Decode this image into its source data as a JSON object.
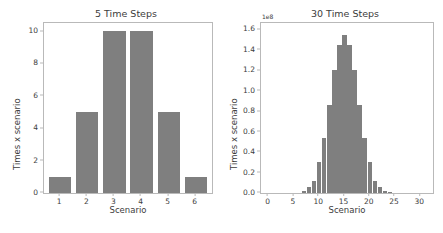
{
  "figure": {
    "background_color": "#ffffff",
    "bar_color": "#7f7f7f",
    "axis_color": "#b9b9b9"
  },
  "chart_data": [
    {
      "type": "bar",
      "title": "5 Time Steps",
      "xlabel": "Scenario",
      "ylabel": "Times x scenario",
      "categories": [
        1,
        2,
        3,
        4,
        5,
        6
      ],
      "values": [
        1,
        5,
        10,
        10,
        5,
        1
      ],
      "xticks": [
        1,
        2,
        3,
        4,
        5,
        6
      ],
      "yticks": [
        0,
        2,
        4,
        6,
        8,
        10
      ],
      "xlim": [
        0.4,
        6.6
      ],
      "ylim": [
        0,
        10.5
      ],
      "grid": false,
      "legend": "none"
    },
    {
      "type": "bar",
      "title": "30 Time Steps",
      "xlabel": "Scenario",
      "ylabel": "Times x scenario",
      "y_offset_text": "1e8",
      "y_offset_multiplier": 100000000,
      "categories": [
        7,
        8,
        9,
        10,
        11,
        12,
        13,
        14,
        15,
        16,
        17,
        18,
        19,
        20,
        21,
        22,
        23,
        24
      ],
      "values": [
        0.02,
        0.06,
        0.12,
        0.3,
        0.54,
        0.86,
        1.2,
        1.45,
        1.54,
        1.45,
        1.2,
        0.86,
        0.54,
        0.3,
        0.12,
        0.06,
        0.02,
        0.01
      ],
      "value_units": "1e8",
      "xticks": [
        0,
        5,
        10,
        15,
        20,
        25,
        30
      ],
      "yticks": [
        "0.0",
        "0.2",
        "0.4",
        "0.6",
        "0.8",
        "1.0",
        "1.2",
        "1.4",
        "1.6"
      ],
      "ytick_values": [
        0.0,
        0.2,
        0.4,
        0.6,
        0.8,
        1.0,
        1.2,
        1.4,
        1.6
      ],
      "xlim": [
        -1.5,
        32.5
      ],
      "ylim": [
        0,
        1.66
      ],
      "grid": false,
      "legend": "none"
    }
  ]
}
